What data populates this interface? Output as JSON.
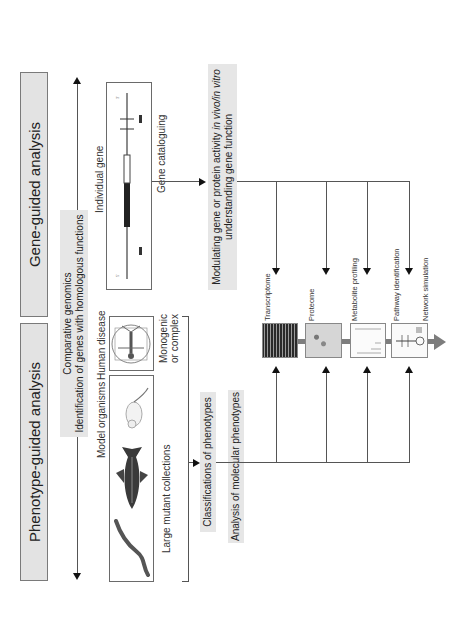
{
  "figure": {
    "orientation": "rotated 90 degrees counter-clockwise",
    "titles": {
      "phenotype": "Phenotype-guided analysis",
      "gene": "Gene-guided analysis"
    },
    "comparative": {
      "line1": "Comparative genomics",
      "line2": "Identification of genes with homologous functions"
    },
    "model_organisms": {
      "label": "Model organisms",
      "caption": "Large mutant collections",
      "icons": [
        "worm-icon",
        "fish-icon",
        "mouse-icon"
      ]
    },
    "human_disease": {
      "label": "Human disease",
      "caption_line1": "Monogenic",
      "caption_line2": "or complex",
      "icon": "vitruvian-man-icon"
    },
    "individual_gene": {
      "label": "Individual gene",
      "caption": "Gene cataloguing"
    },
    "classification": "Classifications of phenotypes",
    "molecular": "Analysis of molecular phenotypes",
    "modulating": {
      "line1_prefix": "Modulating gene or protein activity ",
      "line1_italic": "in vivo/in vitro",
      "line2": "understanding gene function"
    },
    "omics": [
      {
        "label": "Transcriptome",
        "thumb": "microarray-thumbnail"
      },
      {
        "label": "Proteome",
        "thumb": "2d-gel-thumbnail"
      },
      {
        "label": "Metabolite profiling",
        "thumb": "spectrum-thumbnail"
      },
      {
        "label": "Pathway identification",
        "thumb": "pathway-thumbnail"
      },
      {
        "label": "Network simulation",
        "thumb": ""
      }
    ],
    "colors": {
      "title_fill": "#e3e3e3",
      "label_fill": "#e6e6e6",
      "line": "#555555",
      "flow_arrow": "#7d7d7d"
    }
  }
}
